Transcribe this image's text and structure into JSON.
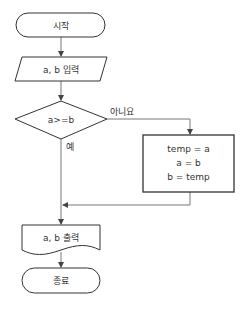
{
  "diagram": {
    "type": "flowchart",
    "nodes": {
      "start": {
        "shape": "terminal",
        "label": "시작"
      },
      "input": {
        "shape": "parallelogram",
        "label": "a, b 입력"
      },
      "decision": {
        "shape": "diamond",
        "label": "a>=b"
      },
      "swap": {
        "shape": "process",
        "lines": [
          "temp = a",
          "a = b",
          "b = temp"
        ]
      },
      "output": {
        "shape": "document",
        "label": "a, b 출력"
      },
      "end": {
        "shape": "terminal",
        "label": "종료"
      }
    },
    "edges": {
      "yes_label": "예",
      "no_label": "아니요"
    },
    "colors": {
      "stroke": "#333333",
      "connector": "#777777",
      "text": "#333333",
      "background": "#ffffff"
    }
  }
}
